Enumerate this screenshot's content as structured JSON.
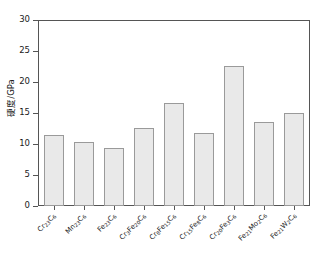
{
  "chart_data": {
    "type": "bar",
    "title": "",
    "xlabel": "",
    "ylabel": "硬度/GPa",
    "ylim": [
      0,
      30
    ],
    "ytick_values": [
      0,
      5,
      10,
      15,
      20,
      25,
      30
    ],
    "ytick_labels": [
      "0",
      "5",
      "10",
      "15",
      "20",
      "25",
      "30"
    ],
    "grid": false,
    "legend": false,
    "bar_fill_color": "#e9e9e9",
    "bar_edge_color": "#9a9a9a",
    "categories": [
      "Cr23C6",
      "Mn23C6",
      "Fe23C6",
      "Cr3Fe20C6",
      "Cr8Fe15C6",
      "Cr15Fe8C6",
      "Cr20Fe3C6",
      "Fe21Mo2C6",
      "Fe21W2C6"
    ],
    "category_labels_html": [
      "Cr<sub>23</sub>C<sub>6</sub>",
      "Mn<sub>23</sub>C<sub>6</sub>",
      "Fe<sub>23</sub>C<sub>6</sub>",
      "Cr<sub>3</sub>Fe<sub>20</sub>C<sub>6</sub>",
      "Cr<sub>8</sub>Fe<sub>15</sub>C<sub>6</sub>",
      "Cr<sub>15</sub>Fe<sub>8</sub>C<sub>6</sub>",
      "Cr<sub>20</sub>Fe<sub>3</sub>C<sub>6</sub>",
      "Fe<sub>21</sub>Mo<sub>2</sub>C<sub>6</sub>",
      "Fe<sub>21</sub>W<sub>2</sub>C<sub>6</sub>"
    ],
    "values": [
      11.5,
      10.3,
      9.4,
      12.6,
      16.6,
      11.7,
      22.6,
      13.6,
      15.0
    ]
  }
}
